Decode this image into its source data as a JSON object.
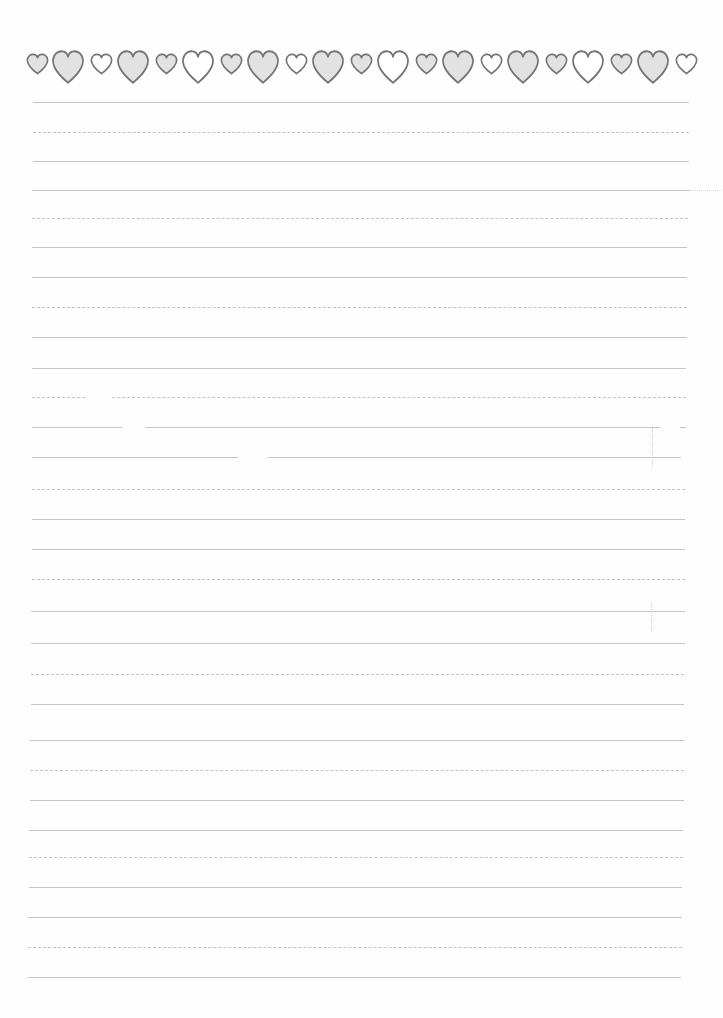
{
  "document": {
    "type": "lined writing paper",
    "background_color": "#fefefe",
    "rule_color": "#c4c4c4"
  },
  "heart_border": {
    "stroke_color": "#747474",
    "gray_fill": "#e2e2e2",
    "white_fill": "#ffffff",
    "hearts": [
      {
        "size": "small",
        "fill": "gray",
        "cx": 37
      },
      {
        "size": "big",
        "fill": "gray",
        "cx": 68
      },
      {
        "size": "small",
        "fill": "white",
        "cx": 101
      },
      {
        "size": "big",
        "fill": "gray",
        "cx": 133
      },
      {
        "size": "small",
        "fill": "gray",
        "cx": 166
      },
      {
        "size": "big",
        "fill": "white",
        "cx": 198
      },
      {
        "size": "small",
        "fill": "gray",
        "cx": 231
      },
      {
        "size": "big",
        "fill": "gray",
        "cx": 263
      },
      {
        "size": "small",
        "fill": "white",
        "cx": 296
      },
      {
        "size": "big",
        "fill": "gray",
        "cx": 328
      },
      {
        "size": "small",
        "fill": "gray",
        "cx": 361
      },
      {
        "size": "big",
        "fill": "white",
        "cx": 393
      },
      {
        "size": "small",
        "fill": "gray",
        "cx": 426
      },
      {
        "size": "big",
        "fill": "gray",
        "cx": 458
      },
      {
        "size": "small",
        "fill": "white",
        "cx": 491
      },
      {
        "size": "big",
        "fill": "gray",
        "cx": 523
      },
      {
        "size": "small",
        "fill": "gray",
        "cx": 556
      },
      {
        "size": "big",
        "fill": "white",
        "cx": 588
      },
      {
        "size": "small",
        "fill": "gray",
        "cx": 621
      },
      {
        "size": "big",
        "fill": "gray",
        "cx": 653
      },
      {
        "size": "small",
        "fill": "white",
        "cx": 686
      }
    ]
  },
  "ruled_lines": {
    "count": 30,
    "lines": [
      {
        "y": 102,
        "x1": 33,
        "x2": 689
      },
      {
        "y": 132,
        "x1": 33,
        "x2": 689
      },
      {
        "y": 161,
        "x1": 33,
        "x2": 689
      },
      {
        "y": 190,
        "x1": 32,
        "x2": 689
      },
      {
        "y": 218,
        "x1": 32,
        "x2": 688
      },
      {
        "y": 247,
        "x1": 32,
        "x2": 687
      },
      {
        "y": 277,
        "x1": 32,
        "x2": 687
      },
      {
        "y": 307,
        "x1": 32,
        "x2": 687
      },
      {
        "y": 337,
        "x1": 32,
        "x2": 687
      },
      {
        "y": 368,
        "x1": 32,
        "x2": 686
      },
      {
        "y": 397,
        "x1": 32,
        "x2": 686
      },
      {
        "y": 427,
        "x1": 32,
        "x2": 686
      },
      {
        "y": 457,
        "x1": 32,
        "x2": 681
      },
      {
        "y": 489,
        "x1": 32,
        "x2": 685
      },
      {
        "y": 519,
        "x1": 32,
        "x2": 685
      },
      {
        "y": 549,
        "x1": 32,
        "x2": 685
      },
      {
        "y": 579,
        "x1": 32,
        "x2": 685
      },
      {
        "y": 611,
        "x1": 31,
        "x2": 685
      },
      {
        "y": 643,
        "x1": 31,
        "x2": 685
      },
      {
        "y": 674,
        "x1": 31,
        "x2": 684
      },
      {
        "y": 704,
        "x1": 31,
        "x2": 684
      },
      {
        "y": 740,
        "x1": 30,
        "x2": 684
      },
      {
        "y": 770,
        "x1": 30,
        "x2": 684
      },
      {
        "y": 800,
        "x1": 30,
        "x2": 684
      },
      {
        "y": 830,
        "x1": 29,
        "x2": 683
      },
      {
        "y": 857,
        "x1": 29,
        "x2": 683
      },
      {
        "y": 887,
        "x1": 29,
        "x2": 682
      },
      {
        "y": 917,
        "x1": 28,
        "x2": 682
      },
      {
        "y": 947,
        "x1": 28,
        "x2": 682
      },
      {
        "y": 977,
        "x1": 28,
        "x2": 681
      }
    ],
    "gaps": [
      {
        "y": 397,
        "x1": 87,
        "x2": 112
      },
      {
        "y": 427,
        "x1": 122,
        "x2": 145
      },
      {
        "y": 457,
        "x1": 238,
        "x2": 268
      },
      {
        "y": 427,
        "x1": 660,
        "x2": 680
      }
    ]
  },
  "scan_artifacts": [
    {
      "x": 652,
      "y1": 428,
      "y2": 468
    },
    {
      "x": 651,
      "y1": 603,
      "y2": 632
    }
  ],
  "stray_marks": [
    {
      "y": 190,
      "x1": 689,
      "x2": 722
    }
  ]
}
